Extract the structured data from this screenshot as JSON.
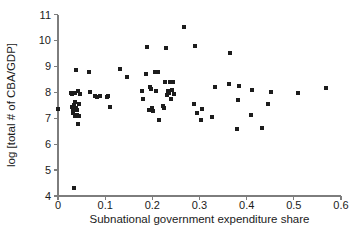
{
  "chart_data": {
    "type": "scatter",
    "title": "",
    "xlabel": "Subnational government expenditure share",
    "ylabel": "log [total # of CBA/GDP]",
    "xlim": [
      0,
      0.6
    ],
    "ylim": [
      4,
      11
    ],
    "xticks": [
      "0",
      "0.1",
      "0.2",
      "0.3",
      "0.4",
      "0.5",
      "0.6"
    ],
    "xtick_values": [
      0,
      0.1,
      0.2,
      0.3,
      0.4,
      0.5,
      0.6
    ],
    "yticks": [
      "4",
      "5",
      "6",
      "7",
      "8",
      "9",
      "10",
      "11"
    ],
    "ytick_values": [
      4,
      5,
      6,
      7,
      8,
      9,
      10,
      11
    ],
    "grid": false,
    "legend": null,
    "marker": {
      "shape": "square",
      "color": "#1c1c1c",
      "size_px": 4
    },
    "series": [
      {
        "name": "observations",
        "points": [
          [
            0.001,
            7.37
          ],
          [
            0.027,
            7.97
          ],
          [
            0.029,
            7.93
          ],
          [
            0.03,
            7.45
          ],
          [
            0.031,
            7.33
          ],
          [
            0.032,
            7.22
          ],
          [
            0.033,
            7.52
          ],
          [
            0.034,
            4.3
          ],
          [
            0.035,
            7.96
          ],
          [
            0.036,
            7.62
          ],
          [
            0.037,
            7.08
          ],
          [
            0.038,
            7.4
          ],
          [
            0.039,
            8.85
          ],
          [
            0.04,
            7.12
          ],
          [
            0.041,
            7.3
          ],
          [
            0.042,
            6.78
          ],
          [
            0.043,
            8.05
          ],
          [
            0.044,
            7.56
          ],
          [
            0.045,
            7.1
          ],
          [
            0.046,
            7.94
          ],
          [
            0.065,
            8.8
          ],
          [
            0.068,
            8.03
          ],
          [
            0.078,
            7.84
          ],
          [
            0.083,
            7.82
          ],
          [
            0.088,
            7.85
          ],
          [
            0.104,
            7.82
          ],
          [
            0.107,
            7.86
          ],
          [
            0.11,
            7.44
          ],
          [
            0.131,
            8.9
          ],
          [
            0.147,
            8.6
          ],
          [
            0.178,
            8.04
          ],
          [
            0.181,
            7.73
          ],
          [
            0.186,
            8.72
          ],
          [
            0.189,
            9.75
          ],
          [
            0.192,
            7.33
          ],
          [
            0.195,
            8.22
          ],
          [
            0.197,
            8.14
          ],
          [
            0.199,
            7.41
          ],
          [
            0.201,
            7.28
          ],
          [
            0.206,
            8.79
          ],
          [
            0.208,
            8.05
          ],
          [
            0.211,
            8.8
          ],
          [
            0.214,
            6.95
          ],
          [
            0.222,
            7.48
          ],
          [
            0.224,
            7.38
          ],
          [
            0.227,
            8.4
          ],
          [
            0.229,
            9.7
          ],
          [
            0.232,
            7.9
          ],
          [
            0.234,
            8.06
          ],
          [
            0.236,
            7.98
          ],
          [
            0.238,
            8.38
          ],
          [
            0.24,
            7.76
          ],
          [
            0.242,
            8.1
          ],
          [
            0.244,
            8.41
          ],
          [
            0.246,
            7.95
          ],
          [
            0.267,
            10.52
          ],
          [
            0.288,
            7.55
          ],
          [
            0.29,
            9.78
          ],
          [
            0.294,
            7.21
          ],
          [
            0.303,
            6.92
          ],
          [
            0.306,
            7.34
          ],
          [
            0.327,
            7.06
          ],
          [
            0.332,
            8.21
          ],
          [
            0.362,
            8.32
          ],
          [
            0.364,
            9.53
          ],
          [
            0.379,
            6.6
          ],
          [
            0.381,
            7.7
          ],
          [
            0.384,
            8.23
          ],
          [
            0.409,
            7.14
          ],
          [
            0.412,
            8.1
          ],
          [
            0.432,
            6.64
          ],
          [
            0.446,
            7.53
          ],
          [
            0.452,
            8.02
          ],
          [
            0.508,
            7.96
          ],
          [
            0.569,
            8.16
          ]
        ]
      }
    ]
  },
  "axes": {
    "x_axis_name": "x-axis",
    "y_axis_name": "y-axis"
  }
}
